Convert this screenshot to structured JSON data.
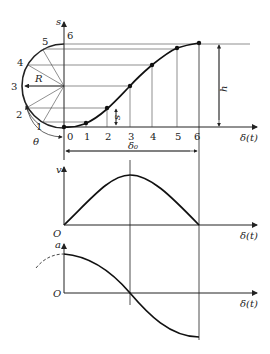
{
  "top_plot": {
    "y_axis_label": "s",
    "x_axis_label": "δ(t)",
    "circle_radius_label": "R",
    "angle_label": "θ",
    "circle_point_labels": [
      "0",
      "1",
      "2",
      "3",
      "4",
      "5",
      "6"
    ],
    "x_tick_labels": [
      "0",
      "1",
      "2",
      "3",
      "4",
      "5",
      "6"
    ],
    "displacement_label": "s",
    "height_label": "h",
    "span_label": "δ₀"
  },
  "velocity_plot": {
    "y_axis_label": "v",
    "origin_label": "O",
    "x_axis_label": "δ(t)"
  },
  "acceleration_plot": {
    "y_axis_label": "a",
    "origin_label": "O",
    "x_axis_label": "δ(t)"
  },
  "colors": {
    "line": "#222222",
    "thin": "#333333"
  }
}
